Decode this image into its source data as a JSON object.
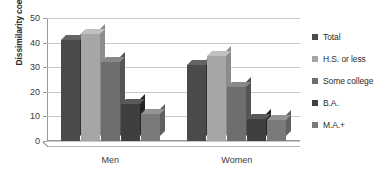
{
  "chart_data": {
    "type": "bar",
    "title": "",
    "xlabel": "",
    "ylabel": "Dissimilarity coefficient",
    "categories": [
      "Men",
      "Women"
    ],
    "ylim": [
      0,
      50
    ],
    "yticks": [
      0,
      10,
      20,
      30,
      40,
      50
    ],
    "grid": true,
    "legend_position": "right",
    "series": [
      {
        "name": "Total",
        "color": "#4a4a4a",
        "values": [
          41,
          31
        ]
      },
      {
        "name": "H.S. or less",
        "color": "#a6a6a6",
        "values": [
          43.5,
          34.5
        ]
      },
      {
        "name": "Some college",
        "color": "#6e6e6e",
        "values": [
          32,
          22
        ]
      },
      {
        "name": "B.A.",
        "color": "#3f3f3f",
        "values": [
          15,
          9
        ]
      },
      {
        "name": "M.A.+",
        "color": "#7a7a7a",
        "values": [
          11,
          8.5
        ]
      }
    ]
  },
  "axis": {
    "y_title": "Dissimilarity coefficient",
    "tick_labels": [
      "50",
      "40",
      "30",
      "20",
      "10",
      "0"
    ]
  },
  "legend": {
    "items": [
      {
        "label": "Total"
      },
      {
        "label": "H.S. or less"
      },
      {
        "label": "Some college"
      },
      {
        "label": "B.A."
      },
      {
        "label": "M.A.+"
      }
    ]
  }
}
